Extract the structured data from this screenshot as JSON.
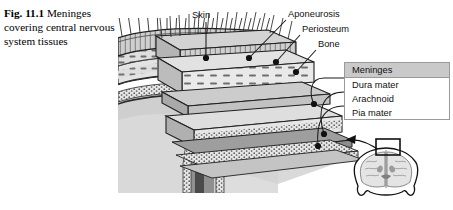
{
  "figure": {
    "caption_number": "Fig. 11.1",
    "caption_text": "Meninges covering central nervous system tissues"
  },
  "labels": {
    "skin": "Skin",
    "aponeurosis": "Aponeurosis",
    "periosteum": "Periosteum",
    "bone": "Bone"
  },
  "meninges_box": {
    "header": "Meninges",
    "items": [
      "Dura mater",
      "Arachnoid",
      "Pia mater"
    ]
  },
  "inset": {
    "description": "coronal brain section with region-of-interest box"
  },
  "colors": {
    "box_header": "#c9c9c9",
    "box_border": "#9a9a9a",
    "ink": "#111111",
    "tissue_light": "#dcdcdc",
    "tissue_mid": "#b4b4b4",
    "tissue_dark": "#8a8a8a",
    "page": "#ffffff"
  }
}
